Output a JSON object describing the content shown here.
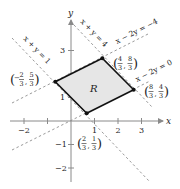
{
  "figure": {
    "type": "feasible-region-diagram",
    "region_label": "R",
    "axes": {
      "x_label": "x",
      "y_label": "y",
      "x_ticks": [
        "−2",
        "1",
        "2",
        "3"
      ],
      "y_ticks": [
        "3",
        "1",
        "−1",
        "−2"
      ]
    },
    "lines": [
      {
        "equation": "x + y = 1",
        "style": "dashed"
      },
      {
        "equation": "x + y = 4",
        "style": "dashed"
      },
      {
        "equation": "x − 2y = −4",
        "style": "dashed"
      },
      {
        "equation": "x − 2y = 0",
        "style": "dashed"
      }
    ],
    "vertices": [
      {
        "label": "(−2/3, 5/3)",
        "x_num": "2",
        "x_den": "3",
        "x_sign": "−",
        "y_num": "5",
        "y_den": "3"
      },
      {
        "label": "(4/3, 8/3)",
        "x_num": "4",
        "x_den": "3",
        "x_sign": "",
        "y_num": "8",
        "y_den": "3"
      },
      {
        "label": "(8/3, 4/3)",
        "x_num": "8",
        "x_den": "3",
        "x_sign": "",
        "y_num": "4",
        "y_den": "3"
      },
      {
        "label": "(2/3, 1/3)",
        "x_num": "2",
        "x_den": "3",
        "x_sign": "",
        "y_num": "1",
        "y_den": "3"
      }
    ],
    "colors": {
      "region_fill": "#e6e6e6",
      "region_stroke": "#111111",
      "axis": "#8a8a8a",
      "dashed_line": "#9a9a9a",
      "text": "#222222"
    }
  }
}
